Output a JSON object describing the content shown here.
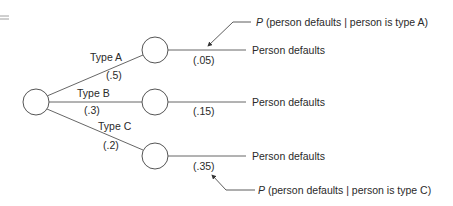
{
  "diagram": {
    "type": "probability-tree",
    "equals_mark": "=",
    "root": {
      "label": ""
    },
    "branches": [
      {
        "label": "Type A",
        "probability": "(.5)",
        "outcome_probability": "(.05)",
        "outcome_label": "Person defaults"
      },
      {
        "label": "Type B",
        "probability": "(.3)",
        "outcome_probability": "(.15)",
        "outcome_label": "Person defaults"
      },
      {
        "label": "Type C",
        "probability": "(.2)",
        "outcome_probability": "(.35)",
        "outcome_label": "Person defaults"
      }
    ],
    "annotations": [
      {
        "prefix": "P",
        "text": " (person defaults | person is type A)",
        "points_to": "(.05)"
      },
      {
        "prefix": "P",
        "text": " (person defaults | person is type C)",
        "points_to": "(.35)"
      }
    ]
  }
}
